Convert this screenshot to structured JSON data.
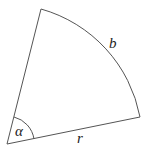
{
  "diagram": {
    "type": "circular-sector",
    "labels": {
      "arc": "b",
      "radius": "r",
      "angle": "α"
    },
    "colors": {
      "stroke": "#555555",
      "text": "#222222",
      "background": "#ffffff"
    }
  }
}
